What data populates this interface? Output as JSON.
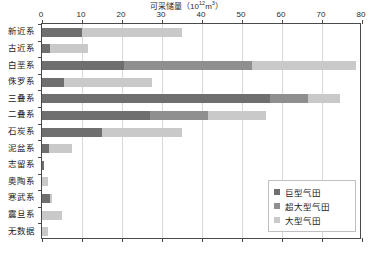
{
  "chart_data": {
    "type": "bar",
    "orientation": "horizontal",
    "stacked": true,
    "title": "可采储量（10",
    "title_sup": "12",
    "title_tail": "m",
    "title_sup2": "3",
    "title_end": "）",
    "title_full": "可采储量（10¹²m³）",
    "xlabel": "",
    "ylabel": "",
    "xlim": [
      0,
      80
    ],
    "xticks": [
      0,
      10,
      20,
      30,
      40,
      50,
      60,
      70,
      80
    ],
    "xtick_labels": [
      "0",
      "10",
      "20",
      "30",
      "40",
      "50",
      "60",
      "70",
      "80"
    ],
    "grid": true,
    "grid_axis": "x",
    "legend_position": "lower-right",
    "categories": [
      "新近系",
      "古近系",
      "白垩系",
      "侏罗系",
      "三叠系",
      "二叠系",
      "石炭系",
      "泥盆系",
      "志留系",
      "奥陶系",
      "寒武系",
      "震旦系",
      "无数据"
    ],
    "series": [
      {
        "name": "巨型气田",
        "color": "#6f6f6f",
        "values": [
          10.0,
          2.0,
          20.5,
          5.5,
          57.0,
          27.0,
          15.0,
          1.8,
          0.5,
          0.0,
          2.0,
          0.0,
          0.0
        ]
      },
      {
        "name": "超大型气田",
        "color": "#8f8f8f",
        "values": [
          0.0,
          0.0,
          32.0,
          0.0,
          9.5,
          14.5,
          0.0,
          0.0,
          0.0,
          0.0,
          0.0,
          0.0,
          0.0
        ]
      },
      {
        "name": "大型气田",
        "color": "#c9c9c9",
        "values": [
          25.0,
          9.5,
          26.0,
          22.0,
          8.0,
          14.5,
          20.0,
          5.7,
          0.0,
          1.5,
          0.6,
          5.0,
          1.5
        ]
      }
    ],
    "totals": [
      35.0,
      11.5,
      78.5,
      27.5,
      74.5,
      56.0,
      35.0,
      7.5,
      0.5,
      1.5,
      2.6,
      5.0,
      1.5
    ]
  }
}
